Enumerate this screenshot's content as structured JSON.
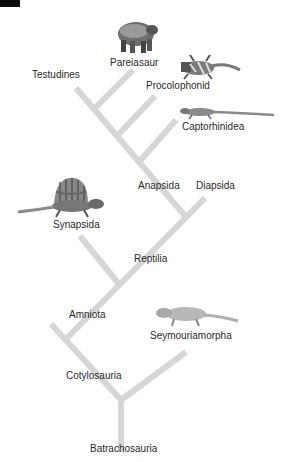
{
  "diagram": {
    "type": "cladogram",
    "branch_color": "#d6d6d6",
    "label_color": "#2a2a2a",
    "labels": {
      "pareiasaur": "Pareiasaur",
      "testudines": "Testudines",
      "procolophonid": "Procolophonid",
      "captorhinidea": "Captorhinidea",
      "anapsida": "Anapsida",
      "diapsida": "Diapsida",
      "synapsida": "Synapsida",
      "reptilia": "Reptilia",
      "amniota": "Amniota",
      "seymouriamorpha": "Seymouriamorpha",
      "cotylosauria": "Cotylosauria",
      "batrachosauria": "Batrachosauria"
    },
    "illustrations": [
      {
        "id": "pareiasaur",
        "icon": "pareiasaur-icon"
      },
      {
        "id": "procolophonid",
        "icon": "procolophonid-lizard-icon"
      },
      {
        "id": "captorhinidea",
        "icon": "captorhinid-lizard-icon"
      },
      {
        "id": "synapsida",
        "icon": "dimetrodon-icon"
      },
      {
        "id": "seymouriamorpha",
        "icon": "seymouria-icon"
      }
    ]
  }
}
